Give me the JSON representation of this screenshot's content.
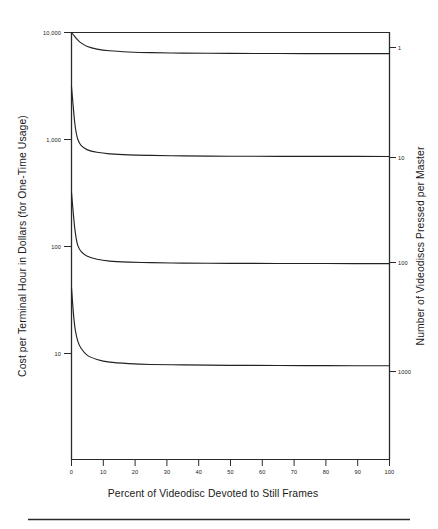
{
  "chart_data": {
    "type": "line",
    "title": "",
    "subtitle": "",
    "xlabel": "Percent of Videodisc Devoted to Still Frames",
    "ylabel": "Cost per Terminal Hour in Dollars (for One-Time Usage)",
    "y2label": "Number of Videodiscs Pressed per Master",
    "xlim": [
      0,
      100
    ],
    "ylim": [
      1,
      10000
    ],
    "yscale": "log",
    "xscale": "linear",
    "grid": false,
    "legend_position": "right-axis-annotations",
    "xticks": [
      "0",
      "10",
      "20",
      "30",
      "40",
      "50",
      "60",
      "70",
      "80",
      "90",
      "100"
    ],
    "xtick_values": [
      0,
      10,
      20,
      30,
      40,
      50,
      60,
      70,
      80,
      90,
      100
    ],
    "yticks": [
      "10,000",
      "1,000",
      "100",
      "10"
    ],
    "ytick_values": [
      10000,
      1000,
      100,
      10
    ],
    "y2ticks": [
      "1",
      "10",
      "100",
      "1000"
    ],
    "y2tick_values": [
      1,
      10,
      100,
      1000
    ],
    "series": [
      {
        "name": "1",
        "label": "1",
        "x": [
          0,
          1,
          2,
          3,
          5,
          8,
          12,
          18,
          25,
          35,
          50,
          65,
          80,
          100
        ],
        "values": [
          10000,
          9200,
          8500,
          8000,
          7400,
          7000,
          6750,
          6580,
          6480,
          6420,
          6380,
          6360,
          6350,
          6340
        ]
      },
      {
        "name": "10",
        "label": "10",
        "x": [
          0,
          0.5,
          1,
          1.5,
          2,
          3,
          5,
          8,
          12,
          18,
          25,
          35,
          50,
          65,
          80,
          100
        ],
        "values": [
          3100,
          2100,
          1450,
          1150,
          1000,
          880,
          800,
          760,
          735,
          718,
          710,
          703,
          698,
          696,
          695,
          694
        ]
      },
      {
        "name": "100",
        "label": "100",
        "x": [
          0,
          0.5,
          1,
          1.5,
          2,
          3,
          5,
          8,
          12,
          18,
          25,
          35,
          50,
          65,
          80,
          100
        ],
        "values": [
          320,
          215,
          150,
          118,
          102,
          90,
          81,
          76,
          73,
          71.5,
          70.6,
          70,
          69.6,
          69.4,
          69.3,
          69.2
        ]
      },
      {
        "name": "1000",
        "label": "1000",
        "x": [
          0,
          0.3,
          0.7,
          1.2,
          2,
          3,
          5,
          8,
          12,
          18,
          25,
          35,
          50,
          65,
          80,
          100
        ],
        "values": [
          41,
          31,
          22,
          16.5,
          13,
          11.2,
          9.6,
          8.8,
          8.3,
          8.05,
          7.9,
          7.82,
          7.75,
          7.72,
          7.7,
          7.68
        ]
      }
    ]
  },
  "axes": {
    "left_title": "Cost per Terminal Hour in Dollars (for One-Time Usage)",
    "right_title": "Number of Videodiscs Pressed per Master",
    "bottom_title": "Percent of Videodisc Devoted to Still Frames"
  },
  "colors": {
    "ink": "#1a1a1a",
    "axis": "#2b2b2b",
    "curve": "#222222",
    "background": "#ffffff"
  }
}
